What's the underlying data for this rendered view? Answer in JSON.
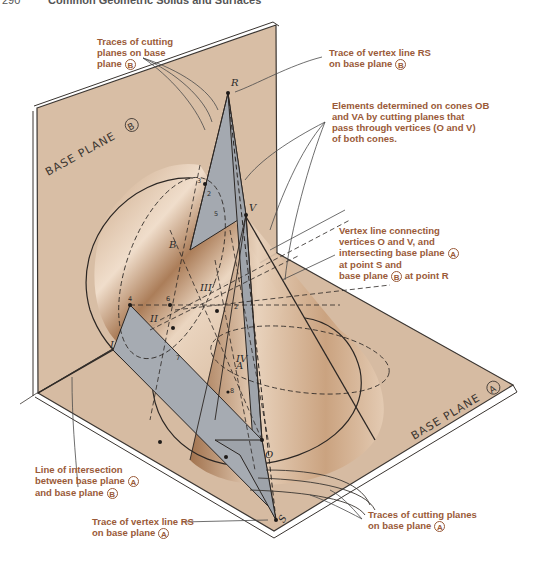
{
  "page_header": {
    "page_number": "290",
    "running_title": "Common Geometric Solids and Surfaces"
  },
  "colors": {
    "plane_fill": "#d9bfa6",
    "plane_edge": "#3a3531",
    "cutting_plane_fill": "#a8acb2",
    "cone_highlight": "#f3e2d2",
    "cone_shadow": "#9a6a45",
    "callout_text": "#9a5a38",
    "leader_line": "#4a4a4a"
  },
  "planes": {
    "vertical": {
      "label": "BASE PLANE",
      "marker": "B"
    },
    "horizontal": {
      "label": "BASE PLANE",
      "marker": "A"
    }
  },
  "points": {
    "R": "R",
    "S": "S",
    "O": "O",
    "V": "V",
    "B": "B",
    "A": "A",
    "one": "1",
    "roman_I": "I",
    "roman_II": "II",
    "roman_III": "III",
    "roman_IV": "IV",
    "n2": "2",
    "n3": "3",
    "n4": "4",
    "n5": "5",
    "n6": "6",
    "n7": "7",
    "n8": "8"
  },
  "callouts": {
    "traces_b": {
      "lines": [
        "Traces of cutting",
        "planes on base",
        "plane"
      ],
      "marker": "B"
    },
    "trace_rs_b": {
      "lines": [
        "Trace of vertex line RS",
        "on base plane"
      ],
      "marker": "B"
    },
    "elements": {
      "lines": [
        "Elements determined on cones OB",
        "and VA by cutting planes that",
        "pass through vertices (O and V)",
        "of both cones."
      ]
    },
    "vertex_line": {
      "lines": [
        "Vertex line connecting",
        "vertices O and V, and",
        "intersecting base plane",
        "at point S and",
        "base plane",
        "at point R"
      ],
      "marker_a": "A",
      "marker_b": "B"
    },
    "intersection": {
      "lines": [
        "Line of intersection",
        "between base plane",
        "and base plane"
      ],
      "marker_a": "A",
      "marker_b": "B"
    },
    "trace_rs_a": {
      "lines": [
        "Trace of vertex line RS",
        "on base plane"
      ],
      "marker": "A"
    },
    "traces_a": {
      "lines": [
        "Traces of cutting planes",
        "on base plane"
      ],
      "marker": "A"
    }
  }
}
